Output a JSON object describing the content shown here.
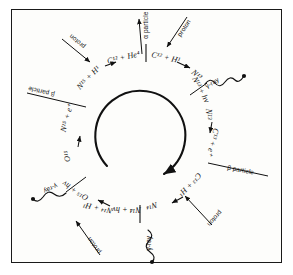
{
  "figure": {
    "type": "carbon-nitrogen-cycle-diagram",
    "title": "",
    "border_color": "#1a1a1a",
    "ink_color": "#111111",
    "background": "#fdfdfb"
  },
  "reactions": {
    "top_left": {
      "text": "N15 + H1",
      "display": "N¹⁵ + H¹",
      "nuclide_a": "N",
      "mass_a": "15",
      "nuclide_b": "H",
      "mass_b": "1"
    },
    "top_left_product": {
      "text": "C12 + He4",
      "display": "C¹² + He⁴"
    },
    "top_right": {
      "text": "C12 + H1",
      "display": "C¹² + H¹"
    },
    "top_right_product": {
      "text": "N13",
      "display": "N¹³"
    },
    "right_upper": {
      "text": "N13 + hv",
      "display": "N¹³ + hν"
    },
    "right_mid_a": {
      "text": "N13",
      "display": "N¹³"
    },
    "right_mid_b": {
      "text": "C13 + e+",
      "display": "C¹³ + e⁺"
    },
    "bottom_right": {
      "text": "C13 + H1",
      "display": "C¹³ + H¹"
    },
    "bottom_right_product": {
      "text": "N14",
      "display": "N¹⁴"
    },
    "bottom_center": {
      "text": "N14 + hv",
      "display": "N¹⁴ + hν"
    },
    "bottom_left": {
      "text": "N14 + H1",
      "display": "N¹⁴ + H¹"
    },
    "bottom_left_product": {
      "text": "O15 + hv",
      "display": "O¹⁵ + hν"
    },
    "left_mid_a": {
      "text": "O15",
      "display": "O¹⁵"
    },
    "left_mid_b": {
      "text": "N15 + e+",
      "display": "N¹⁵ + e⁺"
    }
  },
  "particle_labels": {
    "alpha_top": "α particle",
    "proton_top_right": "proton",
    "proton_top_left": "proton",
    "gamma_right": "γ-ray",
    "beta_right": "β particle",
    "proton_bottom_right": "proton",
    "gamma_bottom": "γ-ray",
    "proton_bottom_left": "proton",
    "gamma_left": "γ-ray",
    "beta_left": "β particle"
  },
  "icons": {
    "cycle_arrow": "circular-arrow-icon",
    "wave": "gamma-wave-icon",
    "arrow": "arrow-icon",
    "divider": "reaction-divider-icon"
  }
}
